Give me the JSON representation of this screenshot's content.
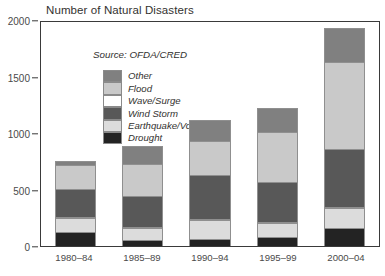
{
  "chart_data": {
    "type": "bar",
    "title": "Number of Natural Disasters",
    "subtitle": "Source: OFDA/CRED",
    "xlabel": "",
    "ylabel": "",
    "ylim": [
      0,
      2000
    ],
    "yticks": [
      0,
      500,
      1000,
      1500,
      2000
    ],
    "ytick_labels": [
      "0",
      "500",
      "1000",
      "1500",
      "2000"
    ],
    "grid": false,
    "stacked": true,
    "legend_position": "inside-top-left",
    "categories": [
      "1980–84",
      "1985–89",
      "1990–94",
      "1995–99",
      "2000–04"
    ],
    "series": [
      {
        "name": "Drought",
        "color": "#232323",
        "values": [
          130,
          55,
          65,
          80,
          165
        ]
      },
      {
        "name": "Earthquake/Volcano",
        "color": "#dcdcdc",
        "values": [
          120,
          110,
          170,
          130,
          180
        ]
      },
      {
        "name": "Wave/Surge",
        "color": "#ffffff",
        "values": [
          10,
          10,
          10,
          10,
          10
        ]
      },
      {
        "name": "Wind Storm",
        "color": "#585858",
        "values": [
          250,
          275,
          390,
          360,
          520
        ]
      },
      {
        "name": "Flood",
        "color": "#c9c9c9",
        "values": [
          215,
          290,
          310,
          440,
          775
        ]
      },
      {
        "name": "Other",
        "color": "#808080",
        "values": [
          30,
          150,
          180,
          210,
          290
        ]
      }
    ],
    "totals": [
      755,
      890,
      1125,
      1230,
      1940
    ],
    "legend_order": [
      "Other",
      "Flood",
      "Wave/Surge",
      "Wind Storm",
      "Earthquake/Volcano",
      "Drought"
    ]
  },
  "legend": {
    "items": [
      {
        "label": "Other",
        "color": "#808080"
      },
      {
        "label": "Flood",
        "color": "#c9c9c9"
      },
      {
        "label": "Wave/Surge",
        "color": "#ffffff"
      },
      {
        "label": "Wind Storm",
        "color": "#585858"
      },
      {
        "label": "Earthquake/Volcano",
        "color": "#dcdcdc"
      },
      {
        "label": "Drought",
        "color": "#232323"
      }
    ]
  },
  "colors": {
    "axis": "#3a3a3a",
    "text": "#33322f",
    "tick_text": "#4a4a4a",
    "background": "#ffffff",
    "segment_border": "#8f8f8f"
  }
}
